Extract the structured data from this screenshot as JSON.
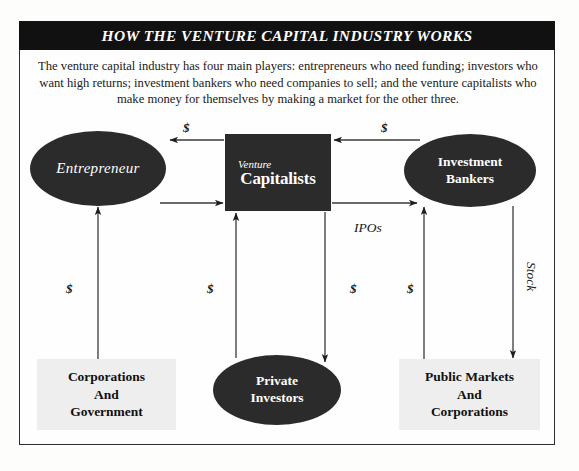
{
  "title": "HOW THE VENTURE CAPITAL INDUSTRY WORKS",
  "intro": "The venture capital industry has four main players: entrepreneurs who need funding; investors who want high returns; investment bankers who need companies to sell; and the venture capitalists who make money for themselves by making a market for the other three.",
  "nodes": {
    "entrepreneur": {
      "label": "Entrepreneur",
      "shape": "ellipse",
      "fill": "#2b2b2b",
      "text_color": "#ffffff"
    },
    "venture_capitalists": {
      "label_small": "Venture",
      "label_big": "Capitalists",
      "shape": "rectangle",
      "fill": "#2b2b2b",
      "text_color": "#ffffff"
    },
    "investment_bankers": {
      "line1": "Investment",
      "line2": "Bankers",
      "shape": "ellipse",
      "fill": "#2b2b2b",
      "text_color": "#ffffff"
    },
    "private_investors": {
      "line1": "Private",
      "line2": "Investors",
      "shape": "ellipse",
      "fill": "#2b2b2b",
      "text_color": "#ffffff"
    },
    "corporations_government": {
      "line1": "Corporations",
      "line2": "And",
      "line3": "Government",
      "shape": "rectangle",
      "fill": "#eeeeee",
      "text_color": "#111111"
    },
    "public_markets_corporations": {
      "line1": "Public Markets",
      "line2": "And",
      "line3": "Corporations",
      "shape": "rectangle",
      "fill": "#eeeeee",
      "text_color": "#111111"
    }
  },
  "edge_labels": {
    "vc_to_entrepreneur": "$",
    "bankers_to_vc": "$",
    "corp_to_entrepreneur": "$",
    "private_to_vc": "$",
    "vc_to_private": "$",
    "public_to_bankers": "$",
    "vc_to_bankers": "IPOs",
    "bankers_to_public": "Stock"
  }
}
